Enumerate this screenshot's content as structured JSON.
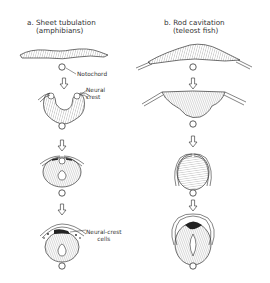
{
  "panels": [
    {
      "id": "a",
      "title_line1": "a.  Sheet tubulation",
      "title_line2": "(amphibians)",
      "labels": {
        "notochord": "Notochord",
        "neural_crest": "Neural\ncrest",
        "neural_crest_line1": "Neural",
        "neural_crest_line2": "crest",
        "neural_crest_cells_line1": "Neural-crest",
        "neural_crest_cells_line2": "cells"
      },
      "stages": 4
    },
    {
      "id": "b",
      "title_line1": "b.  Rod cavitation",
      "title_line2": "(teleost fish)",
      "stages": 4
    }
  ],
  "colors": {
    "line": "#333333",
    "hatch": "#555555",
    "cells": "#222222",
    "background": "#ffffff"
  }
}
